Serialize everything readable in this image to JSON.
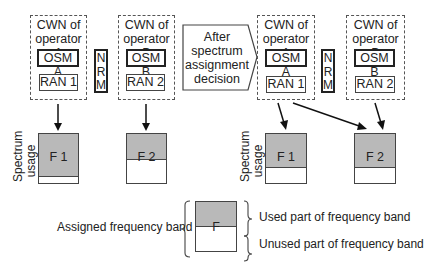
{
  "before": {
    "operator_a": {
      "title_line1": "CWN of",
      "title_line2": "operator A",
      "osm": "OSM A",
      "ran": "RAN 1"
    },
    "nrm": [
      "N",
      "R",
      "M"
    ],
    "operator_b": {
      "title_line1": "CWN of",
      "title_line2": "operator B",
      "osm": "OSM B",
      "ran": "RAN 2"
    },
    "bands": [
      {
        "label": "F 1",
        "used_fraction": 0.83
      },
      {
        "label": "F 2",
        "used_fraction": 0.5
      }
    ]
  },
  "transition": {
    "line1": "After",
    "line2": "spectrum",
    "line3": "assignment",
    "line4": "decision"
  },
  "after": {
    "operator_a": {
      "title_line1": "CWN of",
      "title_line2": "operator A",
      "osm": "OSM A",
      "ran": "RAN 1"
    },
    "nrm": [
      "N",
      "R",
      "M"
    ],
    "operator_b": {
      "title_line1": "CWN of",
      "title_line2": "operator B",
      "osm": "OSM B",
      "ran": "RAN 2"
    },
    "bands": [
      {
        "label": "F 1",
        "used_fraction": 0.66
      },
      {
        "label": "F 2",
        "used_fraction": 0.66
      }
    ]
  },
  "axis_label": {
    "line1": "Spectrum",
    "line2": "usage"
  },
  "legend": {
    "assigned": "Assigned frequency band",
    "band_label": "F",
    "used": "Used part of frequency band",
    "unused": "Unused part of frequency band"
  },
  "colors": {
    "used_fill": "#b9b9b9",
    "line": "#222222"
  }
}
